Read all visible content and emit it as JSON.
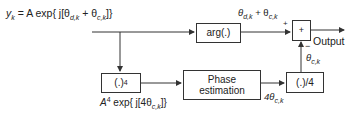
{
  "diagram": {
    "input_label": {
      "lhs": "y",
      "lhs_sub": "k",
      "rhs_prefix": " = A exp{ j[θ",
      "sub1": "d,k",
      "mid": " + θ",
      "sub2": "c,k",
      "suffix": "]}"
    },
    "blocks": {
      "arg": "arg(.)",
      "power4": "(.)",
      "power4_sup": "4",
      "phase_estimation_line1": "Phase",
      "phase_estimation_line2": "estimation",
      "divide4": "(.)/4",
      "summer": "+"
    },
    "signals": {
      "arg_out": {
        "a": "θ",
        "a_sub": "d,k",
        "mid": " + θ",
        "b_sub": "c,k"
      },
      "power4_out": {
        "prefix": "A",
        "sup": "4",
        "mid": " exp{ j[4θ",
        "sub": "c,k",
        "suffix": "]}"
      },
      "phase_out": {
        "prefix": "4θ",
        "sub": "c,k"
      },
      "div_out": {
        "prefix": "θ",
        "sub": "c,k"
      },
      "plus_sign": "+",
      "minus_sign": "−",
      "output": "Output"
    },
    "colors": {
      "line": "#333333",
      "text": "#222222",
      "background": "#ffffff"
    }
  }
}
